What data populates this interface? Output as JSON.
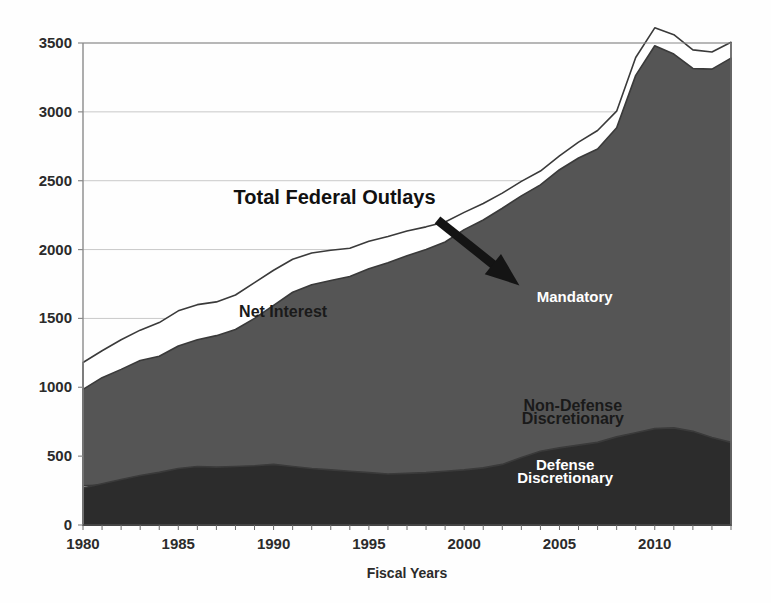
{
  "chart_data": {
    "type": "area",
    "stacked": true,
    "title": "",
    "xlabel": "Fiscal Years",
    "ylabel": "",
    "xlim": [
      1980,
      2014
    ],
    "ylim": [
      0,
      3500
    ],
    "ytick_labels": [
      "0",
      "500",
      "1000",
      "1500",
      "2000",
      "2500",
      "3000",
      "3500"
    ],
    "ytick_values": [
      0,
      500,
      1000,
      1500,
      2000,
      2500,
      3000,
      3500
    ],
    "xtick_labels": [
      "1980",
      "1985",
      "1990",
      "1995",
      "2000",
      "2005",
      "2010"
    ],
    "xtick_values": [
      1980,
      1985,
      1990,
      1995,
      2000,
      2005,
      2010
    ],
    "grid": true,
    "legend_position": "inline-annotations",
    "x": [
      1980,
      1981,
      1982,
      1983,
      1984,
      1985,
      1986,
      1987,
      1988,
      1989,
      1990,
      1991,
      1992,
      1993,
      1994,
      1995,
      1996,
      1997,
      1998,
      1999,
      2000,
      2001,
      2002,
      2003,
      2004,
      2005,
      2006,
      2007,
      2008,
      2009,
      2010,
      2011,
      2012,
      2013,
      2014
    ],
    "series": [
      {
        "name": "Defense Discretionary",
        "color": "#2c2c2c",
        "values": [
          268,
          300,
          330,
          360,
          382,
          410,
          425,
          420,
          425,
          430,
          440,
          425,
          410,
          400,
          390,
          380,
          370,
          375,
          380,
          390,
          400,
          415,
          440,
          490,
          535,
          560,
          580,
          600,
          640,
          670,
          700,
          705,
          680,
          635,
          600
        ]
      },
      {
        "name": "Non-Defense Discretionary",
        "color": "#d2d2d2",
        "values": [
          285,
          290,
          275,
          275,
          280,
          285,
          285,
          285,
          290,
          295,
          305,
          315,
          320,
          320,
          320,
          315,
          305,
          305,
          310,
          320,
          335,
          360,
          395,
          425,
          440,
          450,
          450,
          455,
          490,
          615,
          650,
          620,
          575,
          545,
          540
        ]
      },
      {
        "name": "Mandatory",
        "color": "#555555",
        "values": [
          985,
          1070,
          1130,
          1195,
          1225,
          1300,
          1345,
          1375,
          1420,
          1500,
          1595,
          1690,
          1745,
          1775,
          1805,
          1860,
          1905,
          1955,
          2000,
          2055,
          2145,
          2215,
          2300,
          2390,
          2470,
          2580,
          2665,
          2730,
          2885,
          3265,
          3480,
          3420,
          3315,
          3310,
          3390
        ]
      },
      {
        "name": "Net Interest",
        "color": "#ffffff",
        "values": [
          1180,
          1265,
          1345,
          1415,
          1470,
          1555,
          1600,
          1620,
          1670,
          1760,
          1850,
          1930,
          1975,
          1995,
          2010,
          2060,
          2095,
          2135,
          2165,
          2200,
          2270,
          2335,
          2410,
          2495,
          2570,
          2680,
          2780,
          2865,
          3005,
          3395,
          3610,
          3560,
          3450,
          3435,
          3505
        ]
      }
    ],
    "annotations": [
      {
        "name": "total-federal-outlays",
        "text": "Total Federal Outlays",
        "x": 1993.2,
        "y": 2330
      },
      {
        "name": "net-interest",
        "text": "Net Interest",
        "x": 1990.5,
        "y": 1510
      },
      {
        "name": "mandatory",
        "text": "Mandatory",
        "x": 2005.8,
        "y": 1620
      },
      {
        "name": "non-defense-discretionary-line1",
        "text": "Non-Defense",
        "x": 2005.7,
        "y": 830
      },
      {
        "name": "non-defense-discretionary-line2",
        "text": "Discretionary",
        "x": 2005.7,
        "y": 735
      },
      {
        "name": "defense-discretionary-line1",
        "text": "Defense",
        "x": 2005.3,
        "y": 400
      },
      {
        "name": "defense-discretionary-line2",
        "text": "Discretionary",
        "x": 2005.3,
        "y": 305
      }
    ],
    "arrow": {
      "name": "total-federal-outlays-arrow",
      "from": {
        "x": 1998.6,
        "y": 2215
      },
      "to": {
        "x": 2002.9,
        "y": 1740
      }
    },
    "colors": {
      "defense_discretionary": "#2c2c2c",
      "non_defense_discretionary": "#d2d2d2",
      "mandatory": "#555555",
      "net_interest": "#ffffff",
      "outline": "#3a3a3a",
      "grid": "#c9c9c9",
      "axis": "#8a8a8a",
      "text": "#2b2b2b",
      "background": "#fefefe"
    }
  }
}
